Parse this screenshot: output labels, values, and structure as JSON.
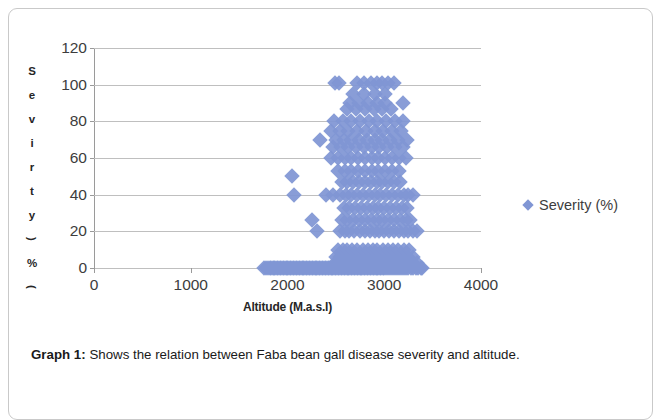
{
  "figure": {
    "caption_label": "Graph 1:",
    "caption_text": " Shows the relation between Faba bean gall disease severity and altitude."
  },
  "legend": {
    "position": "right",
    "entries": [
      {
        "label": "Severity (%)",
        "marker": "diamond-marker-icon",
        "color": "#8096d4"
      }
    ]
  },
  "axis_title_y_chars": [
    "S",
    "e",
    "v",
    "i",
    "r",
    "t",
    "y",
    ")",
    "%",
    "("
  ],
  "chart_data": {
    "type": "scatter",
    "title": "",
    "subtitle": "",
    "xlabel": "Altitude (M.a.s.l)",
    "ylabel": "Sevirty (%)",
    "xlim": [
      0,
      4000
    ],
    "ylim": [
      0,
      120
    ],
    "xticks": [
      "0",
      "1000",
      "2000",
      "3000",
      "4000"
    ],
    "xtick_values": [
      0,
      1000,
      2000,
      3000,
      4000
    ],
    "yticks": [
      "0",
      "20",
      "40",
      "60",
      "80",
      "100",
      "120"
    ],
    "ytick_values": [
      0,
      20,
      40,
      60,
      80,
      100,
      120
    ],
    "grid": "horizontal",
    "marker_color": "#8096d4",
    "marker_shape": "diamond",
    "series": [
      {
        "name": "Severity (%)",
        "points": [
          [
            1760,
            0
          ],
          [
            1780,
            0
          ],
          [
            1800,
            0
          ],
          [
            1815,
            0
          ],
          [
            1830,
            0
          ],
          [
            1845,
            0
          ],
          [
            1860,
            0
          ],
          [
            1875,
            0
          ],
          [
            1890,
            0
          ],
          [
            1905,
            0
          ],
          [
            1920,
            0
          ],
          [
            1935,
            0
          ],
          [
            1950,
            0
          ],
          [
            1965,
            0
          ],
          [
            1980,
            0
          ],
          [
            1995,
            0
          ],
          [
            2010,
            0
          ],
          [
            2025,
            0
          ],
          [
            2040,
            0
          ],
          [
            2055,
            0
          ],
          [
            2070,
            0
          ],
          [
            2085,
            0
          ],
          [
            2100,
            0
          ],
          [
            2115,
            0
          ],
          [
            2130,
            0
          ],
          [
            2145,
            0
          ],
          [
            2160,
            0
          ],
          [
            2175,
            0
          ],
          [
            2190,
            0
          ],
          [
            2205,
            0
          ],
          [
            2220,
            0
          ],
          [
            2235,
            0
          ],
          [
            2250,
            0
          ],
          [
            2265,
            0
          ],
          [
            2280,
            0
          ],
          [
            2295,
            0
          ],
          [
            2310,
            0
          ],
          [
            2325,
            0
          ],
          [
            2340,
            0
          ],
          [
            2355,
            0
          ],
          [
            2370,
            0
          ],
          [
            2385,
            0
          ],
          [
            2400,
            0
          ],
          [
            2415,
            0
          ],
          [
            2430,
            0
          ],
          [
            2445,
            0
          ],
          [
            2460,
            0
          ],
          [
            2475,
            0
          ],
          [
            2490,
            0
          ],
          [
            2505,
            0
          ],
          [
            2520,
            0
          ],
          [
            2535,
            0
          ],
          [
            2550,
            0
          ],
          [
            2565,
            0
          ],
          [
            2580,
            0
          ],
          [
            2595,
            0
          ],
          [
            2610,
            0
          ],
          [
            2625,
            0
          ],
          [
            2640,
            0
          ],
          [
            2655,
            0
          ],
          [
            2670,
            0
          ],
          [
            2685,
            0
          ],
          [
            2700,
            0
          ],
          [
            2715,
            0
          ],
          [
            2730,
            0
          ],
          [
            2745,
            0
          ],
          [
            2760,
            0
          ],
          [
            2775,
            0
          ],
          [
            2790,
            0
          ],
          [
            2805,
            0
          ],
          [
            2820,
            0
          ],
          [
            2835,
            0
          ],
          [
            2850,
            0
          ],
          [
            2865,
            0
          ],
          [
            2880,
            0
          ],
          [
            2895,
            0
          ],
          [
            2910,
            0
          ],
          [
            2925,
            0
          ],
          [
            2940,
            0
          ],
          [
            2955,
            0
          ],
          [
            2970,
            0
          ],
          [
            2985,
            0
          ],
          [
            3000,
            0
          ],
          [
            3020,
            0
          ],
          [
            3040,
            0
          ],
          [
            3060,
            0
          ],
          [
            3080,
            0
          ],
          [
            3100,
            0
          ],
          [
            3120,
            0
          ],
          [
            3140,
            0
          ],
          [
            3160,
            0
          ],
          [
            3180,
            0
          ],
          [
            3200,
            0
          ],
          [
            3225,
            0
          ],
          [
            3250,
            0
          ],
          [
            3275,
            0
          ],
          [
            3300,
            0
          ],
          [
            3325,
            0
          ],
          [
            3350,
            0
          ],
          [
            3375,
            0
          ],
          [
            3395,
            0
          ],
          [
            2490,
            3
          ],
          [
            2530,
            3
          ],
          [
            2570,
            3
          ],
          [
            2610,
            3
          ],
          [
            2650,
            3
          ],
          [
            2700,
            3
          ],
          [
            2760,
            3
          ],
          [
            2810,
            3
          ],
          [
            2860,
            3
          ],
          [
            2905,
            3
          ],
          [
            2950,
            3
          ],
          [
            3000,
            3
          ],
          [
            3050,
            3
          ],
          [
            3100,
            3
          ],
          [
            3150,
            3
          ],
          [
            3200,
            3
          ],
          [
            3250,
            3
          ],
          [
            3300,
            3
          ],
          [
            3340,
            3
          ],
          [
            2505,
            6
          ],
          [
            2545,
            6
          ],
          [
            2590,
            6
          ],
          [
            2640,
            6
          ],
          [
            2690,
            6
          ],
          [
            2740,
            6
          ],
          [
            2790,
            6
          ],
          [
            2840,
            6
          ],
          [
            2890,
            6
          ],
          [
            2940,
            6
          ],
          [
            2990,
            6
          ],
          [
            3040,
            6
          ],
          [
            3090,
            6
          ],
          [
            3140,
            6
          ],
          [
            3190,
            6
          ],
          [
            3250,
            6
          ],
          [
            3300,
            6
          ],
          [
            2520,
            10
          ],
          [
            2570,
            10
          ],
          [
            2620,
            10
          ],
          [
            2670,
            10
          ],
          [
            2720,
            10
          ],
          [
            2780,
            10
          ],
          [
            2830,
            10
          ],
          [
            2880,
            10
          ],
          [
            2930,
            10
          ],
          [
            2985,
            10
          ],
          [
            3035,
            10
          ],
          [
            3090,
            10
          ],
          [
            3140,
            10
          ],
          [
            3200,
            10
          ],
          [
            3260,
            10
          ],
          [
            2300,
            20
          ],
          [
            2540,
            20
          ],
          [
            2590,
            20
          ],
          [
            2640,
            20
          ],
          [
            2690,
            20
          ],
          [
            2750,
            20
          ],
          [
            2800,
            20
          ],
          [
            2850,
            20
          ],
          [
            2900,
            20
          ],
          [
            2950,
            20
          ],
          [
            3000,
            20
          ],
          [
            3050,
            20
          ],
          [
            3100,
            20
          ],
          [
            3150,
            20
          ],
          [
            3200,
            20
          ],
          [
            3250,
            20
          ],
          [
            3300,
            20
          ],
          [
            3340,
            20
          ],
          [
            2250,
            26
          ],
          [
            2560,
            26
          ],
          [
            2620,
            26
          ],
          [
            2680,
            26
          ],
          [
            2740,
            26
          ],
          [
            2800,
            26
          ],
          [
            2860,
            26
          ],
          [
            2920,
            26
          ],
          [
            2980,
            26
          ],
          [
            3040,
            26
          ],
          [
            3100,
            26
          ],
          [
            3160,
            26
          ],
          [
            3220,
            26
          ],
          [
            3270,
            26
          ],
          [
            2580,
            33
          ],
          [
            2640,
            33
          ],
          [
            2700,
            33
          ],
          [
            2760,
            33
          ],
          [
            2820,
            33
          ],
          [
            2880,
            33
          ],
          [
            2940,
            33
          ],
          [
            3000,
            33
          ],
          [
            3060,
            33
          ],
          [
            3120,
            33
          ],
          [
            3180,
            33
          ],
          [
            3240,
            33
          ],
          [
            2070,
            40
          ],
          [
            2400,
            40
          ],
          [
            2470,
            40
          ],
          [
            2540,
            40
          ],
          [
            2600,
            40
          ],
          [
            2660,
            40
          ],
          [
            2720,
            40
          ],
          [
            2780,
            40
          ],
          [
            2840,
            40
          ],
          [
            2900,
            40
          ],
          [
            2960,
            40
          ],
          [
            3020,
            40
          ],
          [
            3080,
            40
          ],
          [
            3140,
            40
          ],
          [
            3200,
            40
          ],
          [
            3250,
            40
          ],
          [
            3300,
            40
          ],
          [
            2050,
            50
          ],
          [
            2560,
            47
          ],
          [
            2620,
            47
          ],
          [
            2680,
            47
          ],
          [
            2740,
            47
          ],
          [
            2800,
            47
          ],
          [
            2860,
            47
          ],
          [
            2920,
            47
          ],
          [
            2980,
            47
          ],
          [
            3040,
            47
          ],
          [
            3100,
            47
          ],
          [
            3160,
            47
          ],
          [
            2520,
            53
          ],
          [
            2590,
            53
          ],
          [
            2660,
            53
          ],
          [
            2730,
            53
          ],
          [
            2800,
            53
          ],
          [
            2870,
            53
          ],
          [
            2940,
            53
          ],
          [
            3010,
            53
          ],
          [
            3080,
            53
          ],
          [
            3150,
            53
          ],
          [
            2450,
            60
          ],
          [
            2520,
            60
          ],
          [
            2590,
            60
          ],
          [
            2660,
            60
          ],
          [
            2730,
            60
          ],
          [
            2800,
            60
          ],
          [
            2870,
            60
          ],
          [
            2940,
            60
          ],
          [
            3010,
            60
          ],
          [
            3080,
            60
          ],
          [
            3150,
            60
          ],
          [
            3220,
            60
          ],
          [
            2470,
            66
          ],
          [
            2550,
            66
          ],
          [
            2630,
            66
          ],
          [
            2710,
            66
          ],
          [
            2790,
            66
          ],
          [
            2870,
            66
          ],
          [
            2950,
            66
          ],
          [
            3030,
            66
          ],
          [
            3110,
            66
          ],
          [
            3190,
            66
          ],
          [
            2340,
            70
          ],
          [
            2500,
            70
          ],
          [
            2580,
            70
          ],
          [
            2660,
            70
          ],
          [
            2740,
            70
          ],
          [
            2820,
            70
          ],
          [
            2900,
            70
          ],
          [
            2980,
            70
          ],
          [
            3060,
            70
          ],
          [
            3140,
            70
          ],
          [
            3230,
            70
          ],
          [
            2450,
            75
          ],
          [
            2540,
            75
          ],
          [
            2630,
            75
          ],
          [
            2720,
            75
          ],
          [
            2810,
            75
          ],
          [
            2900,
            75
          ],
          [
            2990,
            75
          ],
          [
            3080,
            75
          ],
          [
            3170,
            75
          ],
          [
            2480,
            80
          ],
          [
            2570,
            80
          ],
          [
            2660,
            80
          ],
          [
            2750,
            80
          ],
          [
            2840,
            80
          ],
          [
            2930,
            80
          ],
          [
            3020,
            80
          ],
          [
            3110,
            80
          ],
          [
            3190,
            80
          ],
          [
            2620,
            87
          ],
          [
            2710,
            87
          ],
          [
            2800,
            87
          ],
          [
            2890,
            87
          ],
          [
            2980,
            87
          ],
          [
            3070,
            87
          ],
          [
            2650,
            90
          ],
          [
            2740,
            90
          ],
          [
            2830,
            90
          ],
          [
            2920,
            90
          ],
          [
            3010,
            90
          ],
          [
            3190,
            90
          ],
          [
            2680,
            95
          ],
          [
            2790,
            95
          ],
          [
            2900,
            95
          ],
          [
            3010,
            95
          ],
          [
            2495,
            101
          ],
          [
            2530,
            101
          ],
          [
            2720,
            101
          ],
          [
            2790,
            101
          ],
          [
            2860,
            101
          ],
          [
            2920,
            101
          ],
          [
            2980,
            101
          ],
          [
            3040,
            101
          ],
          [
            3100,
            101
          ]
        ]
      }
    ]
  }
}
